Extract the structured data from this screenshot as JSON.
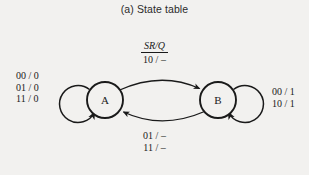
{
  "figure": {
    "caption": "(a) State table",
    "background_color": "#f2f1ef",
    "ink_color": "#1a1a1a"
  },
  "diagram": {
    "type": "state-transition-diagram",
    "input_output_legend": {
      "numerator": "SR/Q",
      "denominator": "10 / –"
    },
    "states": [
      {
        "id": "A",
        "label": "A",
        "cx": 105,
        "cy": 100,
        "r": 18
      },
      {
        "id": "B",
        "label": "B",
        "cx": 218,
        "cy": 100,
        "r": 18
      }
    ],
    "transitions": [
      {
        "name": "self-loop-a",
        "from": "A",
        "to": "A",
        "label_lines": [
          "00 / 0",
          "01 / 0",
          "11 / 0"
        ],
        "label_position": "left"
      },
      {
        "name": "a-to-b",
        "from": "A",
        "to": "B",
        "label_lines": [
          "SR/Q",
          "10 / –"
        ],
        "label_position": "top"
      },
      {
        "name": "b-to-a",
        "from": "B",
        "to": "A",
        "label_lines": [
          "01 / –",
          "11 / –"
        ],
        "label_position": "bottom"
      },
      {
        "name": "self-loop-b",
        "from": "B",
        "to": "B",
        "label_lines": [
          "00 / 1",
          "10 / 1"
        ],
        "label_position": "right"
      }
    ],
    "labels": {
      "left_line_1": "00 / 0",
      "left_line_2": "01 / 0",
      "left_line_3": "11 / 0",
      "right_line_1": "00 / 1",
      "right_line_2": "10 / 1",
      "bottom_line_1": "01 / –",
      "bottom_line_2": "11 / –"
    }
  }
}
